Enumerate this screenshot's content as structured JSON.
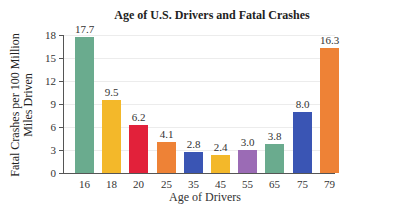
{
  "chart_data": {
    "type": "bar",
    "title": "Age of U.S. Drivers and Fatal Crashes",
    "xlabel": "Age of Drivers",
    "ylabel": "Fatal Crashes per 100 Million Miles Driven",
    "ylabel_lines": [
      "Fatal Crashes per 100 Million",
      "Miles Driven"
    ],
    "categories": [
      "16",
      "18",
      "20",
      "25",
      "35",
      "45",
      "55",
      "65",
      "75",
      "79"
    ],
    "values": [
      17.7,
      9.5,
      6.2,
      4.1,
      2.8,
      2.4,
      3.0,
      3.8,
      8.0,
      16.3
    ],
    "value_labels": [
      "17.7",
      "9.5",
      "6.2",
      "4.1",
      "2.8",
      "2.4",
      "3.0",
      "3.8",
      "8.0",
      "16.3"
    ],
    "colors": [
      "#6aab8e",
      "#f3b82a",
      "#e2213a",
      "#ee8236",
      "#3a55b4",
      "#f3b82a",
      "#9b6bb5",
      "#6aab8e",
      "#3a55b4",
      "#ee8236"
    ],
    "yticks": [
      "0",
      "3",
      "6",
      "9",
      "12",
      "15",
      "18"
    ],
    "ylim": [
      0,
      18
    ],
    "grid": true,
    "legend": null
  }
}
